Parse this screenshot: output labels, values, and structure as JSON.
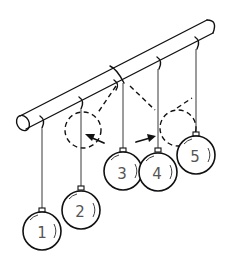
{
  "diagram": {
    "labels": {
      "ball_1": "1",
      "ball_2": "2",
      "ball_3": "3",
      "ball_4": "4",
      "ball_5": "5"
    },
    "colors": {
      "line": "#111111",
      "label": "#555555",
      "background": "#ffffff"
    }
  }
}
